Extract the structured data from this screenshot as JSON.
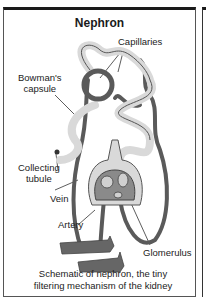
{
  "title": "Nephron",
  "labels": {
    "capillaries": "Capillaries",
    "bowmans_capsule_line1": "Bowman's",
    "bowmans_capsule_line2": "capsule",
    "collecting_tubule_line1": "Collecting",
    "collecting_tubule_line2": "tubule",
    "vein": "Vein",
    "artery": "Artery",
    "glomerulus": "Glomerulus"
  },
  "caption": {
    "line1": "Schematic of nephron, the tiny",
    "line2": "filtering mechanism of the kidney"
  },
  "colors": {
    "tubule_fill": "#d9d9d9",
    "vessel_dark": "#5a5a5a",
    "outline": "#444444"
  }
}
